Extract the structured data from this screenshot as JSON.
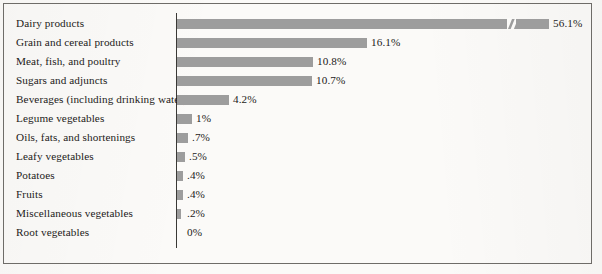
{
  "figure": {
    "background_color": "#fbfaf8",
    "border_color": "#6e6c68",
    "bar_color": "#9d9d9d",
    "text_color": "#1d1b19",
    "axis_color": "#3a3936"
  },
  "chart_data": {
    "type": "bar",
    "orientation": "horizontal",
    "title": "",
    "subtitle": "",
    "xlabel": "",
    "ylabel": "",
    "grid": false,
    "legend": null,
    "axis_break": {
      "present": true,
      "series_index": 0,
      "note": "diagonal break mark on the 56.1% bar indicating a compressed scale"
    },
    "xlim": [
      0,
      56.1
    ],
    "categories": [
      "Dairy products",
      "Grain and cereal products",
      "Meat, fish, and poultry",
      "Sugars and adjuncts",
      "Beverages (including drinking water)",
      "Legume vegetables",
      "Oils, fats, and shortenings",
      "Leafy vegetables",
      "Potatoes",
      "Fruits",
      "Miscellaneous vegetables",
      "Root vegetables"
    ],
    "values": [
      56.1,
      16.1,
      10.8,
      10.7,
      4.2,
      1.0,
      0.7,
      0.5,
      0.4,
      0.4,
      0.2,
      0.0
    ],
    "value_labels": [
      "56.1%",
      "16.1%",
      "10.8%",
      "10.7%",
      "4.2%",
      "1%",
      ".7%",
      ".5%",
      ".4%",
      ".4%",
      ".2%",
      "0%"
    ]
  },
  "rows": [
    {
      "label": "Dairy products",
      "value_label": "56.1%",
      "bar_px": 372,
      "top": 14,
      "break_at_px": 330
    },
    {
      "label": "Grain and cereal products",
      "value_label": "16.1%",
      "bar_px": 190,
      "top": 33,
      "break_at_px": null
    },
    {
      "label": "Meat, fish, and poultry",
      "value_label": "10.8%",
      "bar_px": 136,
      "top": 52,
      "break_at_px": null
    },
    {
      "label": "Sugars and adjuncts",
      "value_label": "10.7%",
      "bar_px": 135,
      "top": 71,
      "break_at_px": null
    },
    {
      "label": "Beverages (including drinking water)",
      "value_label": "4.2%",
      "bar_px": 52,
      "top": 90,
      "break_at_px": null
    },
    {
      "label": "Legume vegetables",
      "value_label": "1%",
      "bar_px": 15,
      "top": 109,
      "break_at_px": null
    },
    {
      "label": "Oils, fats, and shortenings",
      "value_label": ".7%",
      "bar_px": 11,
      "top": 128,
      "break_at_px": null
    },
    {
      "label": "Leafy vegetables",
      "value_label": ".5%",
      "bar_px": 8,
      "top": 147,
      "break_at_px": null
    },
    {
      "label": "Potatoes",
      "value_label": ".4%",
      "bar_px": 6,
      "top": 166,
      "break_at_px": null
    },
    {
      "label": "Fruits",
      "value_label": ".4%",
      "bar_px": 6,
      "top": 185,
      "break_at_px": null
    },
    {
      "label": "Miscellaneous vegetables",
      "value_label": ".2%",
      "bar_px": 4,
      "top": 204,
      "break_at_px": null
    },
    {
      "label": "Root vegetables",
      "value_label": "0%",
      "bar_px": 0,
      "top": 223,
      "break_at_px": null
    }
  ]
}
